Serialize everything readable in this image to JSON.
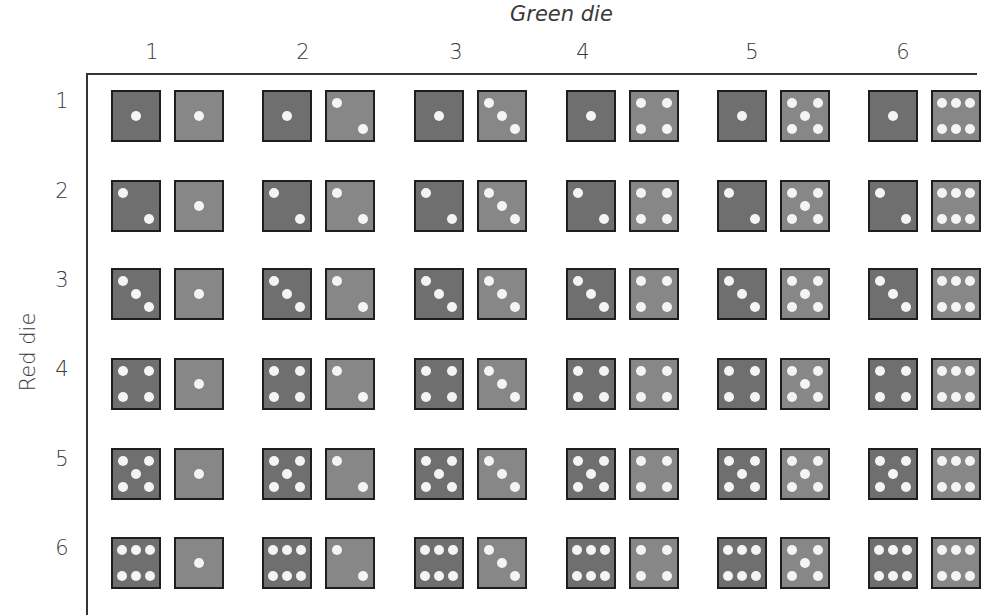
{
  "title": "Green die",
  "y_axis_label": "Red die",
  "columns": [
    {
      "label": "1",
      "value": 1
    },
    {
      "label": "2",
      "value": 2
    },
    {
      "label": "3",
      "value": 3
    },
    {
      "label": "4",
      "value": 4
    },
    {
      "label": "5",
      "value": 5
    },
    {
      "label": "6",
      "value": 6
    }
  ],
  "rows": [
    {
      "label": "1",
      "value": 1
    },
    {
      "label": "2",
      "value": 2
    },
    {
      "label": "3",
      "value": 3
    },
    {
      "label": "4",
      "value": 4
    },
    {
      "label": "5",
      "value": 5
    },
    {
      "label": "6",
      "value": 6
    }
  ],
  "colors": {
    "red_die": "#6f6f6f",
    "green_die": "#878787",
    "pip": "#f4f4f4",
    "border": "#1e1e1e"
  }
}
